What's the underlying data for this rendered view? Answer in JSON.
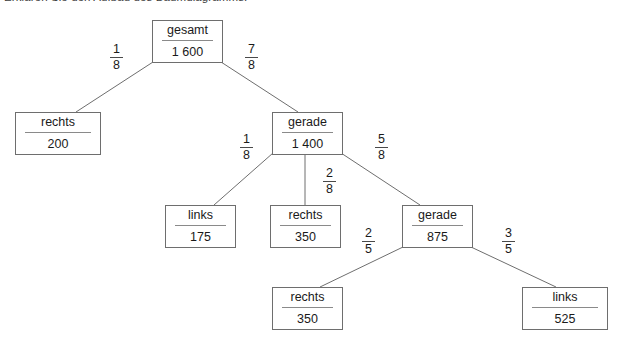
{
  "caption": {
    "text": "Erklären Sie den Aufbau des Baumdiagramms."
  },
  "diagram": {
    "line_color": "#6e6e6e",
    "text_color": "#1a1a1a",
    "background": "#ffffff",
    "nodes": [
      {
        "id": "root",
        "label": "gesamt",
        "value": "1 600"
      },
      {
        "id": "rechts200",
        "label": "rechts",
        "value": "200"
      },
      {
        "id": "gerade1400",
        "label": "gerade",
        "value": "1 400"
      },
      {
        "id": "links175",
        "label": "links",
        "value": "175"
      },
      {
        "id": "rechts350a",
        "label": "rechts",
        "value": "350"
      },
      {
        "id": "gerade875",
        "label": "gerade",
        "value": "875"
      },
      {
        "id": "rechts350b",
        "label": "rechts",
        "value": "350"
      },
      {
        "id": "links525",
        "label": "links",
        "value": "525"
      }
    ],
    "edges": [
      {
        "id": "e1",
        "from": "root",
        "to": "rechts200",
        "numerator": "1",
        "denominator": "8"
      },
      {
        "id": "e2",
        "from": "root",
        "to": "gerade1400",
        "numerator": "7",
        "denominator": "8"
      },
      {
        "id": "e3",
        "from": "gerade1400",
        "to": "links175",
        "numerator": "1",
        "denominator": "8"
      },
      {
        "id": "e4",
        "from": "gerade1400",
        "to": "rechts350a",
        "numerator": "2",
        "denominator": "8"
      },
      {
        "id": "e5",
        "from": "gerade1400",
        "to": "gerade875",
        "numerator": "5",
        "denominator": "8"
      },
      {
        "id": "e6",
        "from": "gerade875",
        "to": "rechts350b",
        "numerator": "2",
        "denominator": "5"
      },
      {
        "id": "e7",
        "from": "gerade875",
        "to": "links525",
        "numerator": "3",
        "denominator": "5"
      }
    ]
  }
}
